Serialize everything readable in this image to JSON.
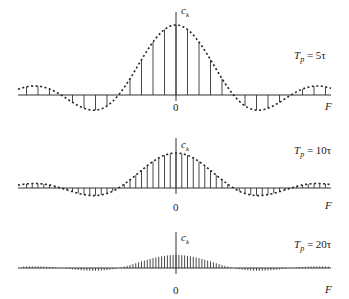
{
  "chart_data": [
    {
      "type": "stem",
      "title": "Tp = 5τ",
      "ylabel": "c_k",
      "xlabel": "F",
      "x_origin_label": "0",
      "period_ratio": 5,
      "harmonic_spacing_px": 11.5,
      "envelope": "sinc (dashed)",
      "description": "Line spectrum of periodic rectangular pulse train; zeros at k = ±5, ±10"
    },
    {
      "type": "stem",
      "title": "Tp = 10τ",
      "ylabel": "c_k",
      "xlabel": "F",
      "x_origin_label": "0",
      "period_ratio": 10,
      "harmonic_spacing_px": 5.75,
      "envelope": "sinc (dashed)",
      "description": "Line spectrum; zeros at k = ±10, ±20"
    },
    {
      "type": "stem",
      "title": "Tp = 20τ",
      "ylabel": "c_k",
      "xlabel": "F",
      "x_origin_label": "0",
      "period_ratio": 20,
      "harmonic_spacing_px": 2.875,
      "envelope": "none",
      "description": "Line spectrum; zeros at k = ±20, ±40"
    }
  ],
  "panels": [
    {
      "tp_var": "T",
      "tp_sub": "p",
      "tp_value": "= 5τ",
      "ck": "c",
      "ck_sub": "k",
      "zero": "0",
      "f": "F"
    },
    {
      "tp_var": "T",
      "tp_sub": "p",
      "tp_value": "= 10τ",
      "ck": "c",
      "ck_sub": "k",
      "zero": "0",
      "f": "F"
    },
    {
      "tp_var": "T",
      "tp_sub": "p",
      "tp_value": "= 20τ",
      "ck": "c",
      "ck_sub": "k",
      "zero": "0",
      "f": "F"
    }
  ]
}
